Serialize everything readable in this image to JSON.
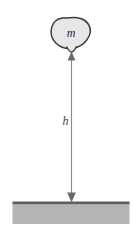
{
  "figure": {
    "kind": "physics-free-body-diagram",
    "caption": "",
    "background_color": "#ffffff"
  },
  "mass": {
    "label": "m",
    "shape_name": "irregular-blob",
    "fill_color": "#e7e7e7",
    "stroke_color": "#3d3d3d"
  },
  "height": {
    "label": "h",
    "arrow_name": "double-headed-vertical-arrow",
    "line_color": "#808080",
    "arrowhead_color": "#6a6a6a"
  },
  "ground": {
    "surface_line_color": "#5e5e5e",
    "fill_color": "#b4b4b4",
    "label": ""
  }
}
